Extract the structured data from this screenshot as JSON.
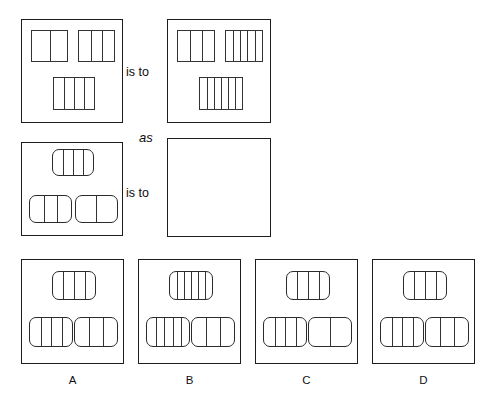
{
  "puzzle": {
    "type": "visual-analogy",
    "connectors": {
      "is_to_1": "is to",
      "as": "as",
      "is_to_2": "is to"
    },
    "rows": [
      {
        "name": "first-analogy-row",
        "panels": [
          {
            "id": "panel-a1",
            "shape_style": "square",
            "figures": [
              {
                "position": "top-left",
                "dividers": 1,
                "cells": 2
              },
              {
                "position": "top-right",
                "dividers": 2,
                "cells": 3
              },
              {
                "position": "bottom-center",
                "dividers": 3,
                "cells": 4
              }
            ]
          },
          {
            "id": "panel-a2",
            "shape_style": "square",
            "figures": [
              {
                "position": "top-left",
                "dividers": 2,
                "cells": 3
              },
              {
                "position": "top-right",
                "dividers": 4,
                "cells": 5
              },
              {
                "position": "bottom-center",
                "dividers": 5,
                "cells": 6
              }
            ]
          }
        ]
      },
      {
        "name": "second-analogy-row",
        "panels": [
          {
            "id": "panel-b1",
            "shape_style": "rounded",
            "figures": [
              {
                "position": "top-center",
                "dividers": 3,
                "cells": 4
              },
              {
                "position": "bottom-left",
                "dividers": 2,
                "cells": 3
              },
              {
                "position": "bottom-right",
                "dividers": 1,
                "cells": 2
              }
            ]
          },
          {
            "id": "panel-b2-answer",
            "shape_style": "empty",
            "figures": []
          }
        ]
      }
    ],
    "options": [
      {
        "id": "option-a",
        "label": "A",
        "figures": [
          {
            "position": "top-center",
            "dividers": 3,
            "cells": 4
          },
          {
            "position": "bottom-left",
            "dividers": 3,
            "cells": 4
          },
          {
            "position": "bottom-right",
            "dividers": 2,
            "cells": 3
          }
        ]
      },
      {
        "id": "option-b",
        "label": "B",
        "figures": [
          {
            "position": "top-center",
            "dividers": 5,
            "cells": 6
          },
          {
            "position": "bottom-left",
            "dividers": 4,
            "cells": 5
          },
          {
            "position": "bottom-right",
            "dividers": 2,
            "cells": 3
          }
        ]
      },
      {
        "id": "option-c",
        "label": "C",
        "figures": [
          {
            "position": "top-center",
            "dividers": 3,
            "cells": 4
          },
          {
            "position": "bottom-left",
            "dividers": 3,
            "cells": 4
          },
          {
            "position": "bottom-right",
            "dividers": 1,
            "cells": 2
          }
        ]
      },
      {
        "id": "option-d",
        "label": "D",
        "figures": [
          {
            "position": "top-center",
            "dividers": 3,
            "cells": 4
          },
          {
            "position": "bottom-left",
            "dividers": 3,
            "cells": 4
          },
          {
            "position": "bottom-right",
            "dividers": 2,
            "cells": 3
          }
        ]
      }
    ]
  },
  "geometry": {
    "panels": {
      "a1": {
        "x": 21,
        "y": 19,
        "w": 102,
        "h": 104
      },
      "a2": {
        "x": 167,
        "y": 19,
        "w": 104,
        "h": 104
      },
      "b1": {
        "x": 21,
        "y": 142,
        "w": 102,
        "h": 94
      },
      "b2": {
        "x": 167,
        "y": 138,
        "w": 104,
        "h": 99
      }
    },
    "options": [
      {
        "x": 21,
        "y": 259,
        "w": 103,
        "h": 105
      },
      {
        "x": 138,
        "y": 259,
        "w": 103,
        "h": 105
      },
      {
        "x": 255,
        "y": 259,
        "w": 103,
        "h": 105
      },
      {
        "x": 372,
        "y": 259,
        "w": 103,
        "h": 105
      }
    ],
    "words": {
      "is_to_1": {
        "x": 126,
        "y": 66
      },
      "as": {
        "x": 139,
        "y": 131
      },
      "is_to_2": {
        "x": 126,
        "y": 187
      }
    },
    "option_labels_y": 375,
    "figure_slots": {
      "square_panel": {
        "top_left": {
          "x": 0.09,
          "y": 0.1,
          "w": 0.36,
          "h": 0.3
        },
        "top_right": {
          "x": 0.55,
          "y": 0.1,
          "w": 0.36,
          "h": 0.3
        },
        "bottom_center": {
          "x": 0.3,
          "y": 0.55,
          "w": 0.42,
          "h": 0.32
        }
      },
      "rounded_panel": {
        "top_center": {
          "x": 0.29,
          "y": 0.06,
          "w": 0.42,
          "h": 0.29
        },
        "bottom_left": {
          "x": 0.07,
          "y": 0.55,
          "w": 0.42,
          "h": 0.3
        },
        "bottom_right": {
          "x": 0.52,
          "y": 0.55,
          "w": 0.42,
          "h": 0.3
        }
      },
      "option_panel": {
        "top_center": {
          "x": 0.29,
          "y": 0.1,
          "w": 0.43,
          "h": 0.28
        },
        "bottom_left": {
          "x": 0.07,
          "y": 0.54,
          "w": 0.43,
          "h": 0.29
        },
        "bottom_right": {
          "x": 0.5,
          "y": 0.54,
          "w": 0.43,
          "h": 0.29
        }
      }
    }
  },
  "colors": {
    "background": "#ffffff",
    "panel_stroke": "#1d1d1d",
    "figure_stroke": "#333333",
    "text": "#0d0d0d"
  }
}
